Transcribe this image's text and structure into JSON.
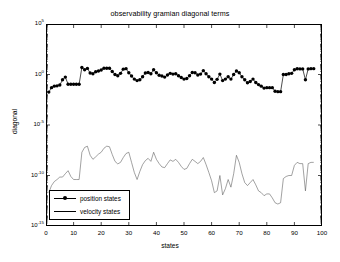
{
  "chart_data": {
    "type": "line",
    "title": "observability gramian diagonal terms",
    "xlabel": "states",
    "ylabel": "diagonal",
    "yscale": "log",
    "xlim": [
      0,
      100
    ],
    "ylim": [
      1e-15,
      100000.0
    ],
    "grid": false,
    "legend_position": "lower left",
    "xticks": [
      0,
      10,
      20,
      30,
      40,
      50,
      60,
      70,
      80,
      90,
      100
    ],
    "xtick_labels": [
      "0",
      "10",
      "20",
      "30",
      "40",
      "50",
      "60",
      "70",
      "80",
      "90",
      "100"
    ],
    "yticks": [
      100000.0,
      1.0,
      1e-05,
      1e-10,
      1e-15
    ],
    "ytick_labels": [
      "10",
      "10",
      "10",
      "10",
      "10"
    ],
    "ytick_exponents": [
      "5",
      "0",
      "-5",
      "-10",
      "-15"
    ],
    "series": [
      {
        "name": "position states",
        "marker": "circle-filled",
        "linestyle": "solid",
        "color": "#000000",
        "x": [
          1,
          2,
          3,
          4,
          5,
          6,
          7,
          8,
          9,
          10,
          11,
          12,
          13,
          14,
          15,
          16,
          17,
          18,
          19,
          20,
          21,
          22,
          23,
          24,
          25,
          26,
          27,
          28,
          29,
          30,
          31,
          32,
          33,
          34,
          35,
          36,
          37,
          38,
          39,
          40,
          41,
          42,
          43,
          44,
          45,
          46,
          47,
          48,
          49,
          50,
          51,
          52,
          53,
          54,
          55,
          56,
          57,
          58,
          59,
          60,
          61,
          62,
          63,
          64,
          65,
          66,
          67,
          68,
          69,
          70,
          71,
          72,
          73,
          74,
          75,
          76,
          77,
          78,
          79,
          80,
          81,
          82,
          83,
          84,
          85,
          86,
          87,
          88,
          89,
          90,
          91,
          92,
          93,
          94,
          95,
          96,
          97
        ],
        "values": [
          0.018,
          0.05,
          0.07,
          0.075,
          0.09,
          0.3,
          0.55,
          0.11,
          0.11,
          0.11,
          0.11,
          0.11,
          5.0,
          3.0,
          4.0,
          1.4,
          1.2,
          1.9,
          2.2,
          2.8,
          4.2,
          4.2,
          4.2,
          2.0,
          1.0,
          0.75,
          1.3,
          3.4,
          3.8,
          1.5,
          0.7,
          0.35,
          0.25,
          0.3,
          0.6,
          1.4,
          1.6,
          1.2,
          3.0,
          1.5,
          0.85,
          0.7,
          0.55,
          0.9,
          1.3,
          1.1,
          1.2,
          0.75,
          0.5,
          0.35,
          0.4,
          0.75,
          1.6,
          1.5,
          0.9,
          1.1,
          2.4,
          1.2,
          0.6,
          0.35,
          0.16,
          0.33,
          1.1,
          0.25,
          0.35,
          0.6,
          0.35,
          1.0,
          2.2,
          1.5,
          0.6,
          0.3,
          0.15,
          0.2,
          0.35,
          0.16,
          0.1,
          0.07,
          0.045,
          0.05,
          0.05,
          0.05,
          0.022,
          0.02,
          0.02,
          1.0,
          1.0,
          1.2,
          1.3,
          3.0,
          3.7,
          3.6,
          3.6,
          0.3,
          3.6,
          3.8,
          3.8
        ]
      },
      {
        "name": "velocity states",
        "marker": "none",
        "linestyle": "solid",
        "color": "#555555",
        "x": [
          1,
          2,
          3,
          4,
          5,
          6,
          7,
          8,
          9,
          10,
          11,
          12,
          13,
          14,
          15,
          16,
          17,
          18,
          19,
          20,
          21,
          22,
          23,
          24,
          25,
          26,
          27,
          28,
          29,
          30,
          31,
          32,
          33,
          34,
          35,
          36,
          37,
          38,
          39,
          40,
          41,
          42,
          43,
          44,
          45,
          46,
          47,
          48,
          49,
          50,
          51,
          52,
          53,
          54,
          55,
          56,
          57,
          58,
          59,
          60,
          61,
          62,
          63,
          64,
          65,
          66,
          67,
          68,
          69,
          70,
          71,
          72,
          73,
          74,
          75,
          76,
          77,
          78,
          79,
          80,
          81,
          82,
          83,
          84,
          85,
          86,
          87,
          88,
          89,
          90,
          91,
          92,
          93,
          94,
          95,
          96,
          97
        ],
        "values": [
          2e-12,
          1e-11,
          2.5e-11,
          4e-11,
          7e-11,
          7e-11,
          1.5e-10,
          3e-10,
          8e-11,
          4e-11,
          4e-11,
          4e-11,
          2e-08,
          6e-08,
          8e-08,
          1e-08,
          4e-09,
          7e-09,
          1.3e-08,
          2e-08,
          5e-08,
          8e-08,
          7e-08,
          1.2e-08,
          2.5e-09,
          1.4e-09,
          2e-09,
          6e-09,
          1.5e-08,
          2e-08,
          2e-09,
          2e-10,
          4e-11,
          2.5e-10,
          1.2e-09,
          3e-09,
          5e-09,
          2.5e-09,
          2e-08,
          4e-09,
          1.5e-09,
          7e-10,
          6e-10,
          1.5e-09,
          3.5e-09,
          2.5e-09,
          4e-09,
          2e-09,
          8e-10,
          4e-10,
          5e-10,
          1.5e-09,
          4e-09,
          2.5e-09,
          1.5e-09,
          2.5e-09,
          6e-09,
          1.2e-09,
          2e-10,
          3e-11,
          2e-12,
          3e-12,
          1e-10,
          1.2e-12,
          5e-12,
          4e-11,
          7e-12,
          1.5e-10,
          1e-08,
          2e-09,
          1.5e-10,
          2e-11,
          1e-11,
          2e-11,
          4e-11,
          1.2e-11,
          3e-12,
          2e-12,
          1e-12,
          1.5e-12,
          1.5e-12,
          6e-13,
          2e-13,
          1.5e-13,
          2e-13,
          5e-11,
          8e-11,
          1e-10,
          1e-10,
          1e-09,
          2e-09,
          1.5e-09,
          1.5e-09,
          3e-12,
          1.5e-09,
          2e-09,
          2e-09
        ]
      }
    ]
  },
  "legend": {
    "entries": [
      {
        "label": "position states"
      },
      {
        "label": "velocity states"
      }
    ]
  }
}
